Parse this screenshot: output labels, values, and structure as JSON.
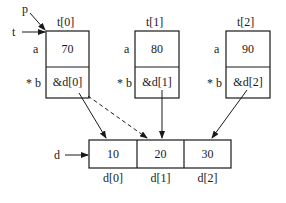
{
  "pointers": {
    "p": "p",
    "t": "t",
    "d": "d"
  },
  "structs": [
    {
      "name": "t[0]",
      "field_a_label": "a",
      "field_b_label": "* b",
      "a": "70",
      "b": "&d[0]"
    },
    {
      "name": "t[1]",
      "field_a_label": "a",
      "field_b_label": "* b",
      "a": "80",
      "b": "&d[1]"
    },
    {
      "name": "t[2]",
      "field_a_label": "a",
      "field_b_label": "* b",
      "a": "90",
      "b": "&d[2]"
    }
  ],
  "array": {
    "values": [
      "10",
      "20",
      "30"
    ],
    "labels": [
      "d[0]",
      "d[1]",
      "d[2]"
    ]
  }
}
